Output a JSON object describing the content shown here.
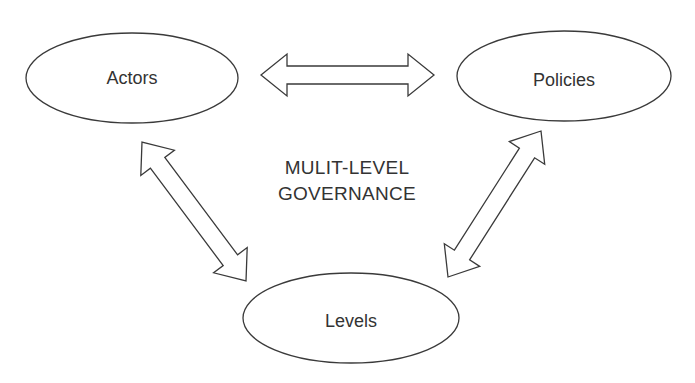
{
  "diagram": {
    "title_lines": [
      "MULIT-LEVEL",
      "GOVERNANCE"
    ],
    "nodes": [
      {
        "id": "actors",
        "label": "Actors"
      },
      {
        "id": "policies",
        "label": "Policies"
      },
      {
        "id": "levels",
        "label": "Levels"
      }
    ],
    "edges": [
      {
        "from": "actors",
        "to": "policies",
        "type": "bidirectional"
      },
      {
        "from": "actors",
        "to": "levels",
        "type": "bidirectional"
      },
      {
        "from": "policies",
        "to": "levels",
        "type": "bidirectional"
      }
    ],
    "colors": {
      "stroke": "#3a3a3a",
      "text": "#333333",
      "background": "#ffffff"
    }
  }
}
